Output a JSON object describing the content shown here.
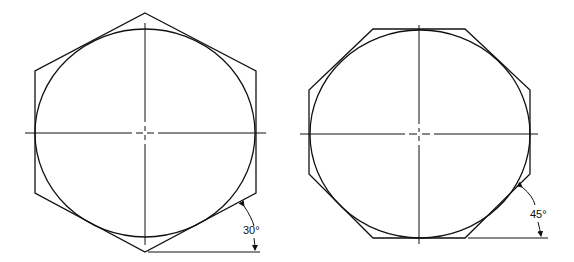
{
  "figures": [
    {
      "name": "hexagon",
      "sides": 6,
      "angle_label": "30°"
    },
    {
      "name": "octagon",
      "sides": 8,
      "angle_label": "45°"
    }
  ]
}
